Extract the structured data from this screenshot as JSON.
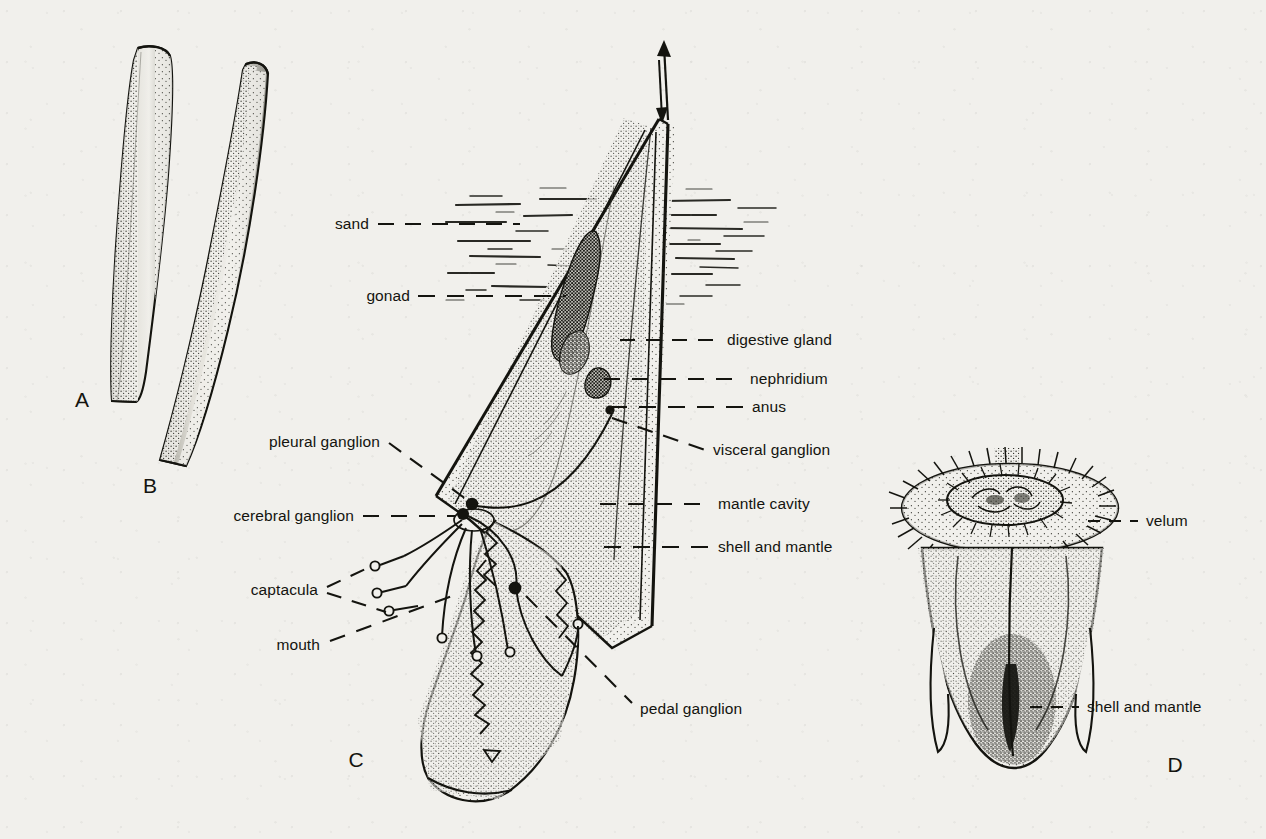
{
  "figure": {
    "background_color": "#f1f0ec",
    "ink_color": "#14140f"
  },
  "panels": [
    {
      "letter": "A",
      "name": "tusk-shell-lateral",
      "x": 82,
      "y": 400
    },
    {
      "letter": "B",
      "name": "tusk-shell-curved",
      "x": 150,
      "y": 486
    },
    {
      "letter": "C",
      "name": "animal-in-sand-cutaway",
      "x": 356,
      "y": 760
    },
    {
      "letter": "D",
      "name": "veliger-larva",
      "x": 1175,
      "y": 765
    }
  ],
  "labels": {
    "sand": "sand",
    "gonad": "gonad",
    "digestive_gland": "digestive gland",
    "nephridium": "nephridium",
    "anus": "anus",
    "visceral_ganglion": "visceral ganglion",
    "mantle_cavity": "mantle cavity",
    "shell_and_mantle": "shell and mantle",
    "pleural_ganglion": "pleural ganglion",
    "cerebral_ganglion": "cerebral ganglion",
    "captacula": "captacula",
    "mouth": "mouth",
    "pedal_ganglion": "pedal ganglion",
    "velum": "velum",
    "shell_and_mantle_d": "shell and mantle"
  },
  "label_positions": {
    "sand": {
      "x": 369,
      "y": 224,
      "align": "l"
    },
    "gonad": {
      "x": 410,
      "y": 296,
      "align": "l"
    },
    "digestive_gland": {
      "x": 727,
      "y": 340,
      "align": "r"
    },
    "nephridium": {
      "x": 750,
      "y": 379,
      "align": "r"
    },
    "anus": {
      "x": 752,
      "y": 407,
      "align": "r"
    },
    "visceral_ganglion": {
      "x": 713,
      "y": 450,
      "align": "r"
    },
    "mantle_cavity": {
      "x": 718,
      "y": 504,
      "align": "r"
    },
    "shell_and_mantle": {
      "x": 718,
      "y": 547,
      "align": "r"
    },
    "pleural_ganglion": {
      "x": 380,
      "y": 442,
      "align": "l"
    },
    "cerebral_ganglion": {
      "x": 354,
      "y": 516,
      "align": "l"
    },
    "captacula": {
      "x": 318,
      "y": 590,
      "align": "l"
    },
    "mouth": {
      "x": 320,
      "y": 645,
      "align": "l"
    },
    "pedal_ganglion": {
      "x": 640,
      "y": 709,
      "align": "r"
    },
    "velum": {
      "x": 1146,
      "y": 521,
      "align": "r"
    },
    "shell_and_mantle_d": {
      "x": 1087,
      "y": 707,
      "align": "r"
    }
  }
}
